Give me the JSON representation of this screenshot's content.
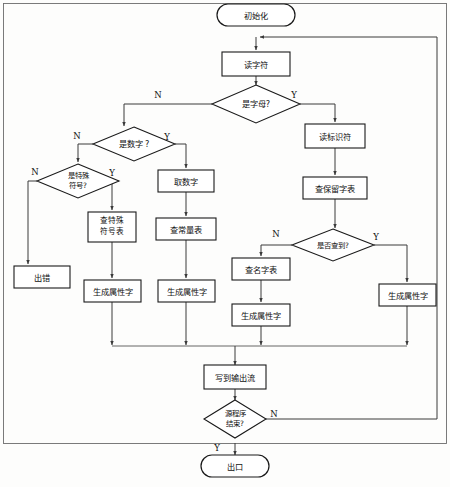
{
  "diagram": {
    "type": "flowchart",
    "language": "zh-CN",
    "colors": {
      "background": "#fdfdfc",
      "node_fill": "#ffffff",
      "node_stroke": "#1a1a1a",
      "connector": "#3a3a3a",
      "frame": "#6d6d6d",
      "text": "#111111"
    },
    "nodes": [
      {
        "id": "start",
        "shape": "terminator",
        "label": "初始化",
        "x": 256,
        "y": 15,
        "w": 78,
        "h": 22
      },
      {
        "id": "read_char",
        "shape": "process",
        "label": "读字符",
        "x": 196,
        "y": 52,
        "w": 68,
        "h": 24
      },
      {
        "id": "is_letter",
        "shape": "decision",
        "label": "是字母?",
        "x": 196,
        "y": 87,
        "w": 88,
        "h": 34
      },
      {
        "id": "is_digit",
        "shape": "decision",
        "label": "是数字 ?",
        "x": 93,
        "y": 128,
        "w": 82,
        "h": 32
      },
      {
        "id": "read_ident",
        "shape": "process",
        "label": "读标识符",
        "x": 305,
        "y": 124,
        "w": 60,
        "h": 24
      },
      {
        "id": "is_special",
        "shape": "decision",
        "label_lines": [
          "是特殊",
          "符号?"
        ],
        "x": 37,
        "y": 164,
        "w": 82,
        "h": 34
      },
      {
        "id": "get_digit",
        "shape": "process",
        "label": "取数字",
        "x": 158,
        "y": 170,
        "w": 56,
        "h": 22
      },
      {
        "id": "check_rsvd",
        "shape": "process",
        "label": "查保留字表",
        "x": 303,
        "y": 177,
        "w": 64,
        "h": 22
      },
      {
        "id": "symbol_table",
        "shape": "process",
        "label_lines": [
          "查特殊",
          "符号表"
        ],
        "x": 88,
        "y": 212,
        "w": 48,
        "h": 30
      },
      {
        "id": "const_table",
        "shape": "process",
        "label": "查常量表",
        "x": 156,
        "y": 218,
        "w": 60,
        "h": 22
      },
      {
        "id": "is_found",
        "shape": "decision",
        "label": "是否查到?",
        "x": 292,
        "y": 230,
        "w": 82,
        "h": 30
      },
      {
        "id": "name_table",
        "shape": "process",
        "label": "查名字表",
        "x": 232,
        "y": 258,
        "w": 58,
        "h": 22
      },
      {
        "id": "error",
        "shape": "process",
        "label": "出错",
        "x": 14,
        "y": 266,
        "w": 56,
        "h": 22
      },
      {
        "id": "attr1",
        "shape": "process",
        "label": "生成属性字",
        "x": 86,
        "y": 280,
        "w": 56,
        "h": 22
      },
      {
        "id": "attr2",
        "shape": "process",
        "label": "生成属性字",
        "x": 159,
        "y": 280,
        "w": 56,
        "h": 22
      },
      {
        "id": "attr4",
        "shape": "process",
        "label": "生成属性字",
        "x": 379,
        "y": 284,
        "w": 56,
        "h": 22
      },
      {
        "id": "attr3",
        "shape": "process",
        "label": "生成属性字",
        "x": 230,
        "y": 304,
        "w": 58,
        "h": 22
      },
      {
        "id": "write_out",
        "shape": "process",
        "label": "写到输出流",
        "x": 204,
        "y": 367,
        "w": 62,
        "h": 22
      },
      {
        "id": "is_eof",
        "shape": "decision",
        "label_lines": [
          "源程序",
          "结束?"
        ],
        "x": 204,
        "y": 409,
        "w": 62,
        "h": 34
      },
      {
        "id": "exit",
        "shape": "terminator",
        "label": "出口",
        "x": 204,
        "y": 457,
        "w": 68,
        "h": 22
      }
    ],
    "branch_labels": [
      {
        "id": "letter-no",
        "text": "N",
        "x": 158,
        "y": 95
      },
      {
        "id": "letter-yes",
        "text": "Y",
        "x": 294,
        "y": 95
      },
      {
        "id": "digit-no",
        "text": "N",
        "x": 77,
        "y": 136
      },
      {
        "id": "digit-yes",
        "text": "Y",
        "x": 167,
        "y": 137
      },
      {
        "id": "special-no",
        "text": "N",
        "x": 35,
        "y": 172
      },
      {
        "id": "special-yes",
        "text": "Y",
        "x": 112,
        "y": 173
      },
      {
        "id": "found-no",
        "text": "N",
        "x": 276,
        "y": 234
      },
      {
        "id": "found-yes",
        "text": "Y",
        "x": 376,
        "y": 237
      },
      {
        "id": "eof-no",
        "text": "N",
        "x": 274,
        "y": 414
      },
      {
        "id": "eof-yes",
        "text": "Y",
        "x": 217,
        "y": 448
      }
    ],
    "edges": [
      {
        "id": "start-to-read",
        "from": "start",
        "to": "read_char"
      },
      {
        "id": "read-to-letter",
        "from": "read_char",
        "to": "is_letter"
      },
      {
        "id": "letter-N-to-digit",
        "from": "is_letter",
        "to": "is_digit",
        "label": "N"
      },
      {
        "id": "letter-Y-to-ident",
        "from": "is_letter",
        "to": "read_ident",
        "label": "Y"
      },
      {
        "id": "digit-N-to-special",
        "from": "is_digit",
        "to": "is_special",
        "label": "N"
      },
      {
        "id": "digit-Y-to-get",
        "from": "is_digit",
        "to": "get_digit",
        "label": "Y"
      },
      {
        "id": "special-N-to-error",
        "from": "is_special",
        "to": "error",
        "label": "N"
      },
      {
        "id": "special-Y-to-symtb",
        "from": "is_special",
        "to": "symbol_table",
        "label": "Y"
      },
      {
        "id": "symtb-to-attr1",
        "from": "symbol_table",
        "to": "attr1"
      },
      {
        "id": "get-to-const",
        "from": "get_digit",
        "to": "const_table"
      },
      {
        "id": "const-to-attr2",
        "from": "const_table",
        "to": "attr2"
      },
      {
        "id": "ident-to-rsvd",
        "from": "read_ident",
        "to": "check_rsvd"
      },
      {
        "id": "rsvd-to-found",
        "from": "check_rsvd",
        "to": "is_found"
      },
      {
        "id": "found-N-to-name",
        "from": "is_found",
        "to": "name_table",
        "label": "N"
      },
      {
        "id": "found-Y-to-attr4",
        "from": "is_found",
        "to": "attr4",
        "label": "Y"
      },
      {
        "id": "name-to-attr3",
        "from": "name_table",
        "to": "attr3"
      },
      {
        "id": "attr1-to-bus",
        "from": "attr1",
        "to": "write_out"
      },
      {
        "id": "attr2-to-bus",
        "from": "attr2",
        "to": "write_out"
      },
      {
        "id": "attr3-to-bus",
        "from": "attr3",
        "to": "write_out"
      },
      {
        "id": "attr4-to-bus",
        "from": "attr4",
        "to": "write_out"
      },
      {
        "id": "write-to-eof",
        "from": "write_out",
        "to": "is_eof"
      },
      {
        "id": "eof-Y-to-exit",
        "from": "is_eof",
        "to": "exit",
        "label": "Y"
      },
      {
        "id": "eof-N-loop-back",
        "from": "is_eof",
        "to": "read_char",
        "label": "N"
      }
    ]
  }
}
